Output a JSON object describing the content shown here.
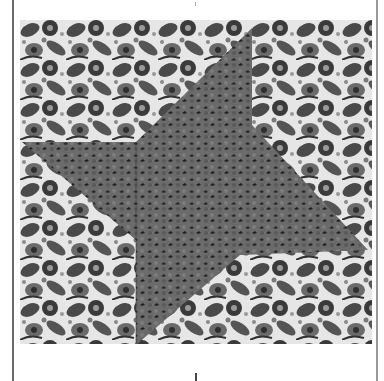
{
  "image": {
    "subject": "Quilt block: star pattern in dark gray leafy fabric on busy gray floral background",
    "colors": {
      "background_page": "#ffffff",
      "floral_light": "#e6e6e6",
      "floral_mid": "#8a8a8a",
      "floral_dark": "#3a3a3a",
      "star_fabric": "#6b6b6b",
      "star_fabric_dark": "#2a2a2a",
      "border_left": "#6a6a6a",
      "border_right": "#9a9a9a"
    },
    "star": {
      "shape": "four-point pinwheel star",
      "points": [
        [
          232,
          8
        ],
        [
          232,
          105
        ],
        [
          348,
          230
        ],
        [
          220,
          235
        ],
        [
          116,
          325
        ],
        [
          116,
          220
        ],
        [
          2,
          122
        ],
        [
          116,
          122
        ]
      ]
    },
    "seam_lines": {
      "vertical_x": 116,
      "color": "#3a3a3a"
    }
  }
}
